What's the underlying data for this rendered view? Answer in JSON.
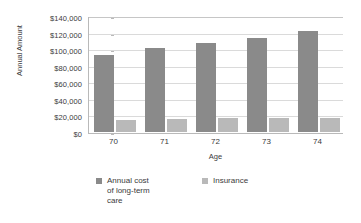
{
  "chart_data": {
    "type": "bar",
    "title": "",
    "subtitle": "",
    "xlabel": "Age",
    "ylabel": "Annual Amount",
    "categories": [
      "70",
      "71",
      "72",
      "73",
      "74"
    ],
    "series": [
      {
        "name": "Annual cost of long-term care",
        "legend_label": "Annual cost\nof long-term\ncare",
        "color": "#8a8a8a",
        "values": [
          92500,
          101000,
          107000,
          113500,
          122000
        ]
      },
      {
        "name": "Insurance",
        "legend_label": "Insurance",
        "color": "#b9b9b9",
        "values": [
          14500,
          15500,
          16500,
          17000,
          17500
        ]
      }
    ],
    "ylim": [
      0,
      140000
    ],
    "ytick_step": 20000,
    "ytick_labels": [
      "$0",
      "$20,000",
      "$40,000",
      "$60,000",
      "$80,000",
      "$100,000",
      "$120,000",
      "$140,000"
    ],
    "ytick_values": [
      0,
      20000,
      40000,
      60000,
      80000,
      100000,
      120000,
      140000
    ],
    "grid": true,
    "grid_axis": "y",
    "legend_position": "bottom",
    "orientation": "vertical",
    "bar_group_count": 5,
    "background_color": "#ffffff",
    "axis_color": "#b9b9b9",
    "grid_color": "#dadada"
  }
}
